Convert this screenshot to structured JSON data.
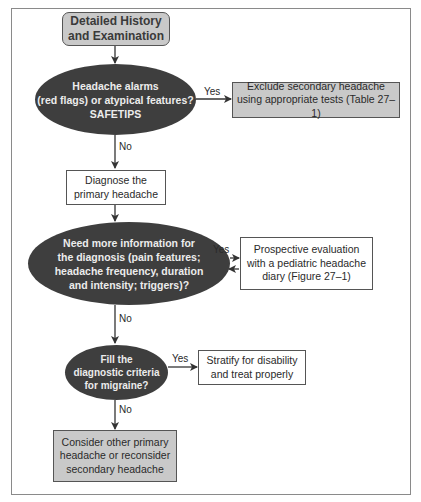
{
  "diagram": {
    "type": "flowchart",
    "nodes": {
      "start": {
        "shape": "rounded-rect",
        "fill": "#c9c9c9",
        "text": "Detailed History\nand Examination"
      },
      "decision_alarms": {
        "shape": "ellipse",
        "fill": "#3e3e3e",
        "text": "Headache alarms\n(red flags) or atypical features?\nSAFETIPS"
      },
      "exclude_secondary": {
        "shape": "rect",
        "fill": "#c9c9c9",
        "text": "Exclude secondary headache\nusing appropriate tests (Table 27–1)"
      },
      "diagnose_primary": {
        "shape": "rect",
        "fill": "#ffffff",
        "text": "Diagnose the\nprimary headache"
      },
      "decision_more_info": {
        "shape": "ellipse",
        "fill": "#3e3e3e",
        "text": "Need more information for\nthe diagnosis (pain features;\nheadache frequency, duration\nand intensity; triggers)?"
      },
      "prospective_eval": {
        "shape": "rect",
        "fill": "#ffffff",
        "text": "Prospective evaluation\nwith a pediatric headache\ndiary (Figure 27–1)"
      },
      "decision_migraine": {
        "shape": "ellipse",
        "fill": "#3e3e3e",
        "text": "Fill the\ndiagnostic criteria\nfor migraine?"
      },
      "stratify": {
        "shape": "rect",
        "fill": "#ffffff",
        "text": "Stratify for disability\nand treat properly"
      },
      "consider_other": {
        "shape": "rect",
        "fill": "#c9c9c9",
        "text": "Consider other primary\nheadache or reconsider\nsecondary headache"
      }
    },
    "edges": [
      {
        "from": "start",
        "to": "decision_alarms",
        "label": ""
      },
      {
        "from": "decision_alarms",
        "to": "exclude_secondary",
        "label": "Yes"
      },
      {
        "from": "decision_alarms",
        "to": "diagnose_primary",
        "label": "No"
      },
      {
        "from": "diagnose_primary",
        "to": "decision_more_info",
        "label": ""
      },
      {
        "from": "decision_more_info",
        "to": "prospective_eval",
        "label": "Yes"
      },
      {
        "from": "prospective_eval",
        "to": "decision_more_info",
        "label": ""
      },
      {
        "from": "decision_more_info",
        "to": "decision_migraine",
        "label": "No"
      },
      {
        "from": "decision_migraine",
        "to": "stratify",
        "label": "Yes"
      },
      {
        "from": "decision_migraine",
        "to": "consider_other",
        "label": "No"
      }
    ],
    "labels": {
      "yes_1": "Yes",
      "no_1": "No",
      "yes_2": "Yes",
      "no_2": "No",
      "yes_3": "Yes",
      "no_3": "No"
    }
  }
}
